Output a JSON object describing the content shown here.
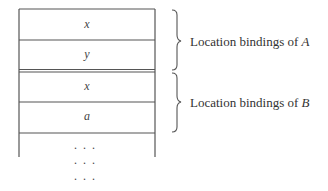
{
  "diagram": {
    "type": "memory-stack",
    "cells": [
      {
        "label": "x"
      },
      {
        "label": "y"
      },
      {
        "label": "x"
      },
      {
        "label": "a"
      }
    ],
    "groups": [
      {
        "prefix": "Location bindings of ",
        "name": "A",
        "cells": [
          0,
          1
        ]
      },
      {
        "prefix": "Location bindings of ",
        "name": "B",
        "cells": [
          2,
          3
        ]
      }
    ],
    "continuation": [
      "· · ·",
      "· · ·",
      "· · ·"
    ]
  }
}
